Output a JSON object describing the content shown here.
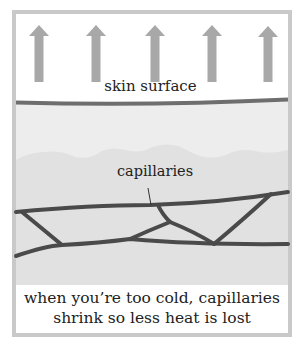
{
  "diagram": {
    "labels": {
      "skin_surface": "skin surface",
      "capillaries": "capillaries"
    },
    "caption": {
      "line1": "when you’re too cold, capillaries",
      "line2": "shrink so less heat is lost"
    },
    "arrows": {
      "count": 5,
      "direction": "up",
      "meaning": "heat-loss"
    },
    "colors": {
      "frame": "#c9c9c9",
      "arrow": "#a8a8a8",
      "skin_line": "#6e6e6e",
      "dermis_upper": "#ededed",
      "dermis_lower": "#e2e2e2",
      "capillary": "#4a4a4a",
      "text": "#222222"
    }
  }
}
